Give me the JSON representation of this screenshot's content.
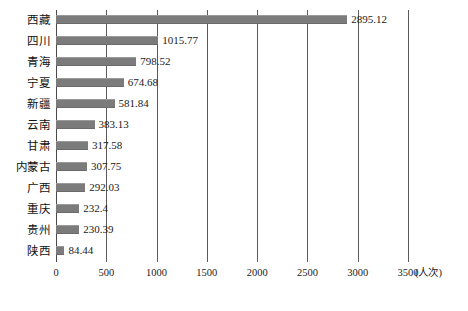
{
  "chart_data": {
    "type": "bar",
    "orientation": "horizontal",
    "title": "",
    "xlabel": "(人次)",
    "ylabel": "",
    "xlim": [
      0,
      3500
    ],
    "xticks": [
      0,
      500,
      1000,
      1500,
      2000,
      2500,
      3000,
      3500
    ],
    "xticklabels": [
      "0",
      "500",
      "1000",
      "1500",
      "2000",
      "2500",
      "3000",
      "3500"
    ],
    "grid": true,
    "grid_axis": "x",
    "legend": false,
    "bar_color": "#7b7b7b",
    "categories": [
      "西藏",
      "四川",
      "青海",
      "宁夏",
      "新疆",
      "云南",
      "甘肃",
      "内蒙古",
      "广西",
      "重庆",
      "贵州",
      "陕西"
    ],
    "values": [
      2895.12,
      1015.77,
      798.52,
      674.68,
      581.84,
      383.13,
      317.58,
      307.75,
      292.03,
      232.4,
      230.39,
      84.44
    ],
    "value_labels": [
      "2895.12",
      "1015.77",
      "798.52",
      "674.68",
      "581.84",
      "383.13",
      "317.58",
      "307.75",
      "292.03",
      "232.4",
      "230.39",
      "84.44"
    ]
  }
}
